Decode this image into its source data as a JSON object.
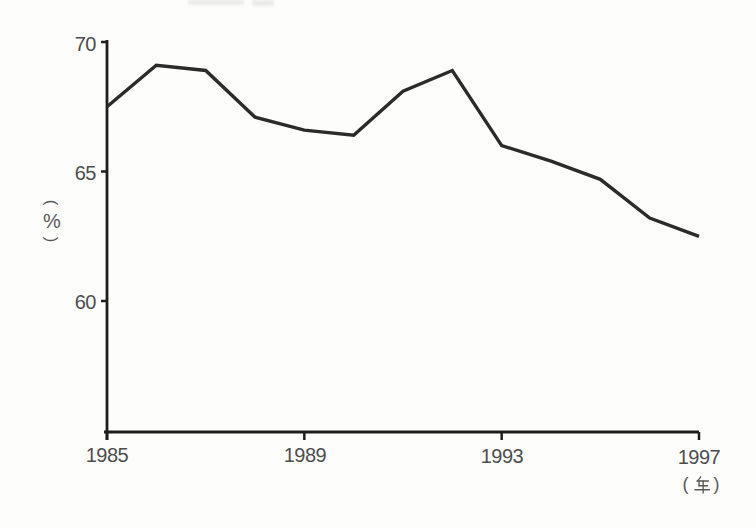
{
  "chart_data": {
    "type": "line",
    "x": [
      1985,
      1986,
      1987,
      1988,
      1989,
      1990,
      1991,
      1992,
      1993,
      1994,
      1995,
      1996,
      1997
    ],
    "values": [
      67.5,
      69.1,
      68.9,
      67.1,
      66.6,
      66.4,
      68.1,
      68.9,
      66.0,
      65.4,
      64.7,
      63.2,
      62.5
    ],
    "x_ticks": [
      1985,
      1989,
      1993,
      1997
    ],
    "y_ticks": [
      70,
      65,
      60
    ],
    "ylim": [
      55,
      70
    ],
    "xlabel": "(年)",
    "ylabel": "(%)",
    "grid": false,
    "legend": "none",
    "line_color": "#2b2b2b",
    "axis_color": "#1e1e1e",
    "label_color": "#4d4d4d"
  },
  "labels": {
    "y_unit_open": "(",
    "y_unit_symbol": "%",
    "y_unit_close": ")",
    "x_unit_open": "(",
    "x_unit_kanji": "年",
    "x_unit_close": ")"
  }
}
